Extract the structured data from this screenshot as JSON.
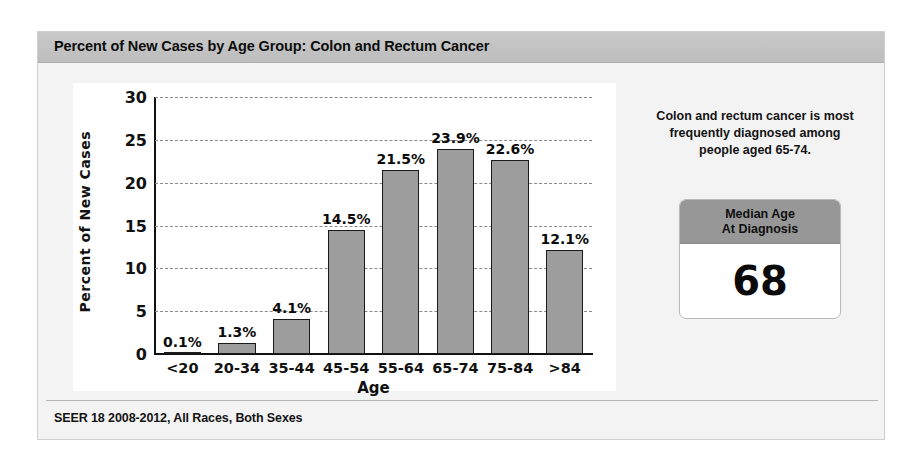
{
  "card": {
    "title": "Percent of New Cases by Age Group: Colon and Rectum Cancer",
    "footer": "SEER 18 2008-2012, All Races, Both Sexes"
  },
  "side_panel": {
    "note": "Colon and rectum cancer is most frequently diagnosed among people aged 65-74.",
    "median_box": {
      "header_line1": "Median Age",
      "header_line2": "At Diagnosis",
      "value": "68"
    }
  },
  "chart_data": {
    "type": "bar",
    "title": "Percent of New Cases by Age Group: Colon and Rectum Cancer",
    "xlabel": "Age",
    "ylabel": "Percent of New Cases",
    "ylim": [
      0,
      30
    ],
    "yticks": [
      "0",
      "5",
      "10",
      "15",
      "20",
      "25",
      "30"
    ],
    "ytick_values": [
      0,
      5,
      10,
      15,
      20,
      25,
      30
    ],
    "grid": "horizontal-dashed",
    "legend": "none",
    "bar_color": "#9d9d9d",
    "bar_edge_color": "#1a1a1a",
    "categories": [
      "<20",
      "20-34",
      "35-44",
      "45-54",
      "55-64",
      "65-74",
      "75-84",
      ">84"
    ],
    "values": [
      0.1,
      1.3,
      4.1,
      14.5,
      21.5,
      23.9,
      22.6,
      12.1
    ],
    "data_labels": [
      "0.1%",
      "1.3%",
      "4.1%",
      "14.5%",
      "21.5%",
      "23.9%",
      "22.6%",
      "12.1%"
    ]
  }
}
